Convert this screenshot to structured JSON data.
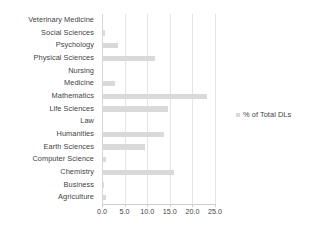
{
  "chart_data": {
    "type": "bar",
    "orientation": "horizontal",
    "title": "",
    "subtitle": "",
    "xlabel": "",
    "ylabel": "",
    "xlim": [
      0.0,
      25.0
    ],
    "xticks": [
      "0.0",
      "5.0",
      "10.0",
      "15.0",
      "20.0",
      "25.0"
    ],
    "xtick_values": [
      0.0,
      5.0,
      10.0,
      15.0,
      20.0,
      25.0
    ],
    "grid": true,
    "grid_axis": "x",
    "legend": {
      "position": "right",
      "entries": [
        {
          "label": "% of Total DLs",
          "color": "#d9d9d9"
        }
      ]
    },
    "categories": [
      "Veterinary Medicine",
      "Social Sciences",
      "Psychology",
      "Physical Sciences",
      "Nursing",
      "Medicine",
      "Mathematics",
      "Life Sciences",
      "Law",
      "Humanities",
      "Earth Sciences",
      "Computer Science",
      "Chemistry",
      "Business",
      "Agriculture"
    ],
    "series": [
      {
        "name": "% of Total DLs",
        "color": "#d9d9d9",
        "values": [
          0.1,
          0.7,
          3.5,
          11.7,
          0.0,
          2.8,
          23.3,
          14.5,
          0.0,
          13.8,
          9.5,
          0.8,
          16.0,
          0.5,
          0.9
        ]
      }
    ]
  },
  "colors": {
    "bar": "#d9d9d9",
    "gridline": "#e4e4e4",
    "axis": "#d0d0d0",
    "text": "#3f3f3f",
    "background": "#ffffff"
  }
}
